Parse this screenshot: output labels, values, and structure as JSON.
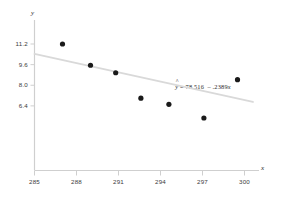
{
  "chart_data": {
    "type": "scatter",
    "title": "",
    "xlabel": "x",
    "ylabel": "y",
    "grid": false,
    "legend": "none",
    "xlim": [
      285,
      302.5
    ],
    "ylim": [
      5.0,
      11.9
    ],
    "xticks": [
      285,
      288,
      291,
      294,
      297,
      300
    ],
    "yticks": [
      6.4,
      8.0,
      9.6,
      11.2
    ],
    "xtick_labels": [
      "285",
      "288",
      "291",
      "294",
      "297",
      "300"
    ],
    "ytick_labels": [
      "6.4",
      "8.0",
      "9.6",
      "11.2"
    ],
    "points": [
      {
        "x": 287.0,
        "y": 11.2
      },
      {
        "x": 289.0,
        "y": 9.55
      },
      {
        "x": 290.8,
        "y": 8.97
      },
      {
        "x": 292.6,
        "y": 7.0
      },
      {
        "x": 294.6,
        "y": 6.52
      },
      {
        "x": 297.1,
        "y": 5.46
      },
      {
        "x": 299.5,
        "y": 8.43
      }
    ],
    "trendline": {
      "intercept": 78.516,
      "slope": -0.2389,
      "x_start": 285.0,
      "x_end": 300.6,
      "color": "#d9d9d9"
    },
    "annotations": [
      {
        "name": "regression-equation",
        "text": "y = 78.516  .2389x",
        "y_symbol": "y",
        "hat": "^",
        "equals": "=",
        "intercept_text": "78.516",
        "minus": "–",
        "slope_text": ".2389",
        "x_symbol": "x",
        "x": 296.2,
        "y": 7.85
      }
    ],
    "colors": {
      "point": "#1a1a1a",
      "axis": "#cfcfcf",
      "trendline": "#dcdcdc",
      "text": "#333333",
      "background": "#ffffff"
    }
  },
  "axes": {
    "y_axis_label": "y",
    "x_axis_label": "x"
  }
}
